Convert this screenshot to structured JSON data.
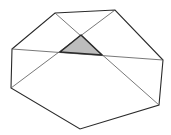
{
  "diagram": {
    "type": "polygon-with-diagonals",
    "colors": {
      "background": "#ffffff",
      "outline": "#2a2a2a",
      "diagonal": "#555555",
      "shade_fill": "#bdbdbd",
      "shade_stroke": "#2a2a2a"
    },
    "polygon": {
      "points": "12,49 55,13 115,10 163,60 159,105 80,129 11,88"
    },
    "diagonals": [
      {
        "x1": 12,
        "y1": 49,
        "x2": 163,
        "y2": 60
      },
      {
        "x1": 55,
        "y1": 13,
        "x2": 159,
        "y2": 105
      },
      {
        "x1": 115,
        "y1": 10,
        "x2": 11,
        "y2": 88
      }
    ],
    "shaded_triangle": {
      "points": "60,52 81,35 102,55"
    }
  }
}
